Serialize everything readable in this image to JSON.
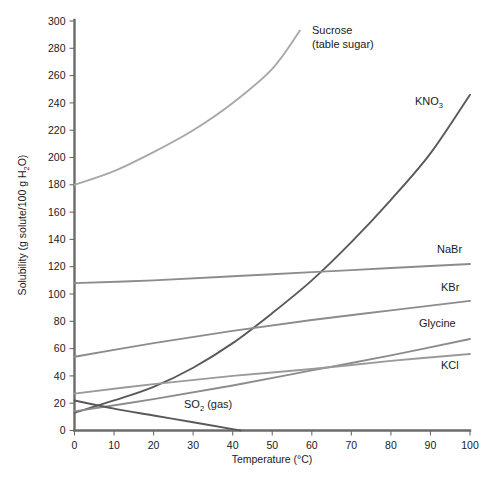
{
  "chart_data": {
    "type": "line",
    "title": "",
    "xlabel": "Temperature (°C)",
    "ylabel": "Solubility (g solute/100 g H₂O)",
    "xlim": [
      0,
      100
    ],
    "ylim": [
      0,
      300
    ],
    "xticks": [
      0,
      10,
      20,
      30,
      40,
      50,
      60,
      70,
      80,
      90,
      100
    ],
    "yticks": [
      0,
      20,
      40,
      60,
      80,
      100,
      120,
      140,
      160,
      180,
      200,
      220,
      240,
      260,
      280,
      300
    ],
    "grid": false,
    "legend": "inline-labels-at-curve-ends",
    "series": [
      {
        "name": "Sucrose (table sugar)",
        "label_line1": "Sucrose",
        "label_line2": "(table sugar)",
        "color": "#a8a8a8",
        "x": [
          0,
          10,
          20,
          30,
          40,
          50,
          57
        ],
        "values": [
          180,
          190,
          204,
          220,
          240,
          265,
          293
        ]
      },
      {
        "name": "KNO3",
        "label_line1": "KNO",
        "label_sub": "3",
        "color": "#595959",
        "x": [
          0,
          10,
          20,
          30,
          40,
          50,
          60,
          70,
          80,
          90,
          100
        ],
        "values": [
          13,
          22,
          32,
          46,
          64,
          86,
          110,
          138,
          169,
          203,
          246
        ]
      },
      {
        "name": "NaBr",
        "label_line1": "NaBr",
        "color": "#8c8c8c",
        "x": [
          0,
          20,
          40,
          60,
          80,
          100
        ],
        "values": [
          108,
          110,
          113,
          116,
          119,
          122
        ]
      },
      {
        "name": "KBr",
        "label_line1": "KBr",
        "color": "#8c8c8c",
        "x": [
          0,
          20,
          40,
          60,
          80,
          100
        ],
        "values": [
          54,
          64,
          73,
          81,
          88,
          95
        ]
      },
      {
        "name": "Glycine",
        "label_line1": "Glycine",
        "color": "#8c8c8c",
        "x": [
          0,
          20,
          40,
          60,
          80,
          100
        ],
        "values": [
          14,
          23,
          33,
          44,
          55,
          67
        ]
      },
      {
        "name": "KCl",
        "label_line1": "KCl",
        "color": "#9a9a9a",
        "x": [
          0,
          20,
          40,
          60,
          80,
          100
        ],
        "values": [
          27,
          34,
          40,
          45,
          51,
          56
        ]
      },
      {
        "name": "SO2 (gas)",
        "label_line1": "SO",
        "label_sub": "2",
        "label_line2": " (gas)",
        "color": "#595959",
        "x": [
          0,
          10,
          20,
          30,
          40,
          42
        ],
        "values": [
          22,
          16,
          11,
          6,
          1,
          0
        ]
      }
    ]
  },
  "axis": {
    "y_tick_labels": [
      "300",
      "280",
      "260",
      "240",
      "220",
      "200",
      "180",
      "160",
      "140",
      "120",
      "100",
      "80",
      "60",
      "40",
      "20",
      "0"
    ],
    "x_tick_labels": [
      "0",
      "10",
      "20",
      "30",
      "40",
      "50",
      "60",
      "70",
      "80",
      "90",
      "100"
    ],
    "x_title": "Temperature (°C)",
    "y_title_part1": "Solubility (g solute/100 g H",
    "y_title_sub": "2",
    "y_title_part2": "O)"
  },
  "labels": {
    "sucrose_l1": "Sucrose",
    "sucrose_l2": "(table sugar)",
    "kno3_main": "KNO",
    "kno3_sub": "3",
    "nabr": "NaBr",
    "kbr": "KBr",
    "glycine": "Glycine",
    "kcl": "KCl",
    "so2_main": "SO",
    "so2_sub": "2",
    "so2_tail": " (gas)"
  },
  "colors": {
    "axis": "#6b6b6b",
    "sucrose": "#a8a8a8",
    "kno3": "#595959",
    "nabr": "#8c8c8c",
    "kbr": "#8c8c8c",
    "glycine": "#8c8c8c",
    "kcl": "#9a9a9a",
    "so2": "#595959",
    "background": "#ffffff",
    "text": "#1a1a1a"
  }
}
